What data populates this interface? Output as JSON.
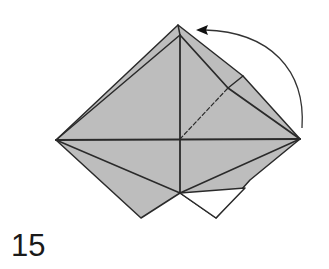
{
  "diagram": {
    "type": "origami-step",
    "step_number": "15",
    "colors": {
      "paper_colored": "#bdbdbd",
      "paper_white": "#ffffff",
      "line": "#2a2a2a",
      "arrow": "#333333"
    },
    "elements": {
      "fold_arrow": "curved arrow from right corner to top point",
      "valley_fold_line": "dashed crease from center toward upper-right flap"
    }
  }
}
